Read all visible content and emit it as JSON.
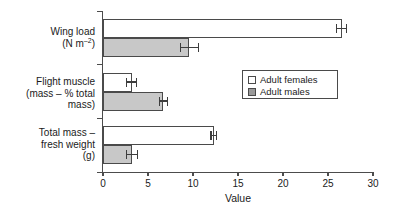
{
  "chart_data": {
    "type": "bar",
    "orientation": "horizontal",
    "title": "",
    "xlabel": "Value",
    "ylabel": "",
    "xlim": [
      0,
      30
    ],
    "xticks": [
      0,
      5,
      10,
      15,
      20,
      25,
      30
    ],
    "xtick_labels": [
      "0",
      "5",
      "10",
      "15",
      "20",
      "25",
      "30"
    ],
    "grid": false,
    "legend_position": "center-right",
    "categories": [
      "Wing load (N m-2)",
      "Flight muscle (mass - % total mass)",
      "Total mass - fresh weight (g)"
    ],
    "category_label_lines": [
      [
        "Wing load",
        "(N m",
        "-2",
        ")"
      ],
      [
        "Flight muscle",
        "(mass – % total",
        "mass)"
      ],
      [
        "Total mass –",
        "fresh weight",
        "(g)"
      ]
    ],
    "series": [
      {
        "name": "Adult females",
        "color": "#ffffff",
        "values": [
          26.5,
          3.2,
          12.3
        ],
        "errors": [
          0.55,
          0.55,
          0.3
        ]
      },
      {
        "name": "Adult males",
        "color": "#c8c8c8",
        "values": [
          9.6,
          6.7,
          3.2
        ],
        "errors": [
          1.0,
          0.45,
          0.6
        ]
      }
    ]
  },
  "legend": {
    "items": [
      {
        "label": "Adult females",
        "swatch": "white-square"
      },
      {
        "label": "Adult males",
        "swatch": "gray-square"
      }
    ]
  },
  "axis": {
    "x_title": "Value"
  },
  "labels": {
    "cat0_line0": "Wing load",
    "cat0_line1_pre": "(N m",
    "cat0_line1_sup": "–2",
    "cat0_line1_post": ")",
    "cat1_line0": "Flight muscle",
    "cat1_line1": "(mass – % total",
    "cat1_line2": "mass)",
    "cat2_line0": "Total mass –",
    "cat2_line1": "fresh weight",
    "cat2_line2": "(g)"
  }
}
